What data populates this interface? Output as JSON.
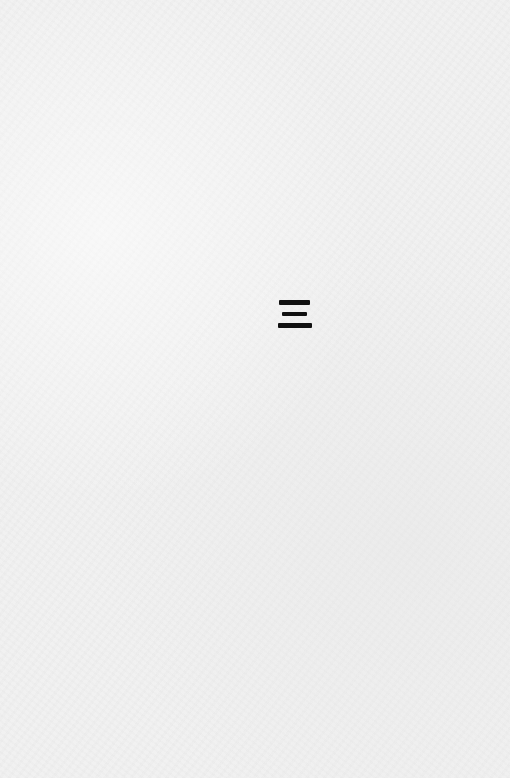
{
  "card": {
    "character": "三",
    "ink_color": "#111111",
    "background_color": "#f1f1f1"
  }
}
